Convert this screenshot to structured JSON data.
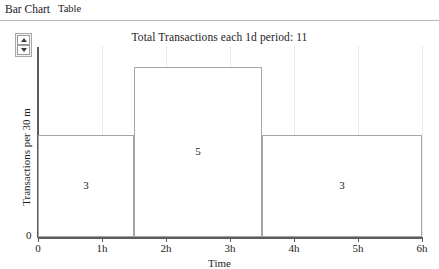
{
  "tabs": [
    {
      "label": "Bar Chart",
      "selected": true,
      "name": "tab-bar-chart"
    },
    {
      "label": "Table",
      "selected": false,
      "name": "tab-table"
    }
  ],
  "spinner": {
    "name": "period-spinner",
    "up_icon": "triangle-up-icon",
    "down_icon": "triangle-down-icon"
  },
  "chart_data": {
    "type": "bar",
    "title": "Total Transactions each 1d period: 11",
    "xlabel": "Time",
    "ylabel": "Transactions per 30 m",
    "categories": [
      "0h-1.5h",
      "1.5h-3.5h",
      "3.5h-6h"
    ],
    "bars": [
      {
        "label": "3",
        "value": 3,
        "x_start": 0,
        "x_end": 1.5
      },
      {
        "label": "5",
        "value": 5,
        "x_start": 1.5,
        "x_end": 3.5
      },
      {
        "label": "3",
        "value": 3,
        "x_start": 3.5,
        "x_end": 6
      }
    ],
    "values": [
      3,
      5,
      3
    ],
    "total": 11,
    "xticks": [
      "0",
      "1h",
      "2h",
      "3h",
      "4h",
      "5h",
      "6h"
    ],
    "xtick_values": [
      0,
      1,
      2,
      3,
      4,
      5,
      6
    ],
    "xlim": [
      0,
      6
    ],
    "yticks": [
      "0"
    ],
    "ytick_values": [
      0
    ],
    "ylim": [
      0,
      5.6
    ],
    "grid": "vertical-dotted",
    "legend": "none",
    "bar_fill": "#ffffff",
    "bar_edge": "#a5a5a5",
    "axis_color": "#5c5c5c",
    "grid_color": "#dcdcd8"
  }
}
